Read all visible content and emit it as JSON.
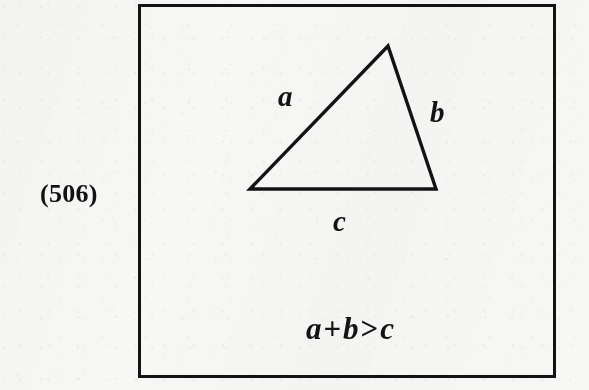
{
  "figure": {
    "number_label": "(506)",
    "frame": {
      "x": 138,
      "y": 4,
      "width": 418,
      "height": 374,
      "border_color": "#131313",
      "border_width": 3
    },
    "background_color": "#f7f7f5",
    "ink_color": "#131313"
  },
  "diagram": {
    "type": "triangle",
    "stroke_color": "#131313",
    "stroke_width": 3.4,
    "vertices": {
      "apex": {
        "x": 385,
        "y": 43
      },
      "bottom_left": {
        "x": 247,
        "y": 186
      },
      "bottom_right": {
        "x": 433,
        "y": 186
      }
    },
    "side_labels": [
      {
        "name": "a",
        "text": "a",
        "x": 288,
        "y": 97,
        "side": "left-slant"
      },
      {
        "name": "b",
        "text": "b",
        "x": 440,
        "y": 113,
        "side": "right-slant"
      },
      {
        "name": "c",
        "text": "c",
        "x": 342,
        "y": 222,
        "side": "base"
      }
    ]
  },
  "inequality": {
    "full_text": "a + b > c",
    "left_term_1": "a",
    "plus_operator": "+",
    "left_term_2": "b",
    "relation_operator": ">",
    "right_term": "c"
  }
}
